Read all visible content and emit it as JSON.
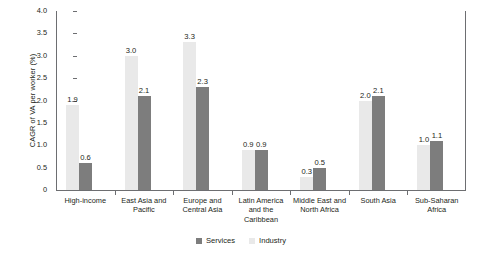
{
  "chart_data": {
    "type": "bar",
    "title": "",
    "subtitle": "",
    "xlabel": "",
    "ylabel": "CAGR of VA per worker (%)",
    "ylim": [
      0,
      4.0
    ],
    "ytick_labels": [
      "4.0",
      "3.5",
      "3.0",
      "2.5",
      "2.0",
      "1.5",
      "1.0",
      "0.5",
      "0"
    ],
    "ytick_values": [
      4.0,
      3.5,
      3.0,
      2.5,
      2.0,
      1.5,
      1.0,
      0.5,
      0
    ],
    "grid": false,
    "legend_position": "bottom-center",
    "categories": [
      "High-income",
      "East Asia and\nPacific",
      "Europe and\nCentral Asia",
      "Latin America\nand the\nCaribbean",
      "Middle East and\nNorth Africa",
      "South Asia",
      "Sub-Saharan\nAfrica"
    ],
    "series": [
      {
        "name": "Industry",
        "color": "#e9e9e9",
        "values": [
          1.9,
          3.0,
          3.3,
          0.9,
          0.3,
          2.0,
          1.0
        ],
        "labels": [
          "1.9",
          "3.0",
          "3.3",
          "0.9",
          "0.3",
          "2.0",
          "1.0"
        ]
      },
      {
        "name": "Services",
        "color": "#7d7d7d",
        "values": [
          0.6,
          2.1,
          2.3,
          0.9,
          0.5,
          2.1,
          1.1
        ],
        "labels": [
          "0.6",
          "2.1",
          "2.3",
          "0.9",
          "0.5",
          "2.1",
          "1.1"
        ]
      }
    ],
    "legend": [
      {
        "label": "Services",
        "color": "#7d7d7d"
      },
      {
        "label": "Industry",
        "color": "#e9e9e9"
      }
    ]
  },
  "colors": {
    "axis": "#6d6e71",
    "text": "#231f20",
    "industry": "#e9e9e9",
    "services": "#7d7d7d",
    "background": "#ffffff"
  }
}
